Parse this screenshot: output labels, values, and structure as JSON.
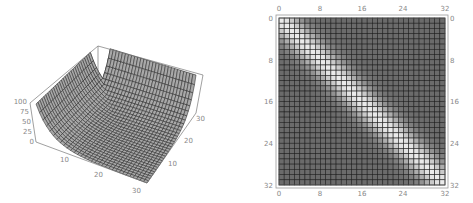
{
  "chart_data": [
    {
      "type": "surface3d",
      "title": "",
      "xlabel": "",
      "ylabel": "",
      "zlabel": "",
      "x_ticks": [
        "10",
        "20",
        "30"
      ],
      "y_ticks": [
        "10",
        "20",
        "30"
      ],
      "z_ticks": [
        "0",
        "25",
        "50",
        "75",
        "100"
      ],
      "xlim": [
        0,
        32
      ],
      "ylim": [
        0,
        32
      ],
      "zlim": [
        0,
        100
      ],
      "grid_size": 32,
      "description": "Mesh surface of a matrix; high values (~100) along two back edges, falling to ~0 over most of the front region (trough shape).",
      "colors": {
        "surface": "#a8a8a8",
        "mesh": "#2a2a2a",
        "box": "#777777"
      }
    },
    {
      "type": "heatmap",
      "title": "",
      "rows": 32,
      "cols": 32,
      "top_ticks": [
        "0",
        "8",
        "16",
        "24",
        "32"
      ],
      "bottom_ticks": [
        "0",
        "8",
        "16",
        "24",
        "32"
      ],
      "left_ticks": [
        "0",
        "8",
        "16",
        "24",
        "32"
      ],
      "right_ticks": [
        "0",
        "8",
        "16",
        "24",
        "32"
      ],
      "xlim": [
        0,
        32
      ],
      "ylim": [
        0,
        32
      ],
      "description": "Grayscale density plot of a 32x32 matrix; bright band along main diagonal (Gaussian falloff, width ~3 cells), dark gray elsewhere.",
      "diagonal_peak": 0.92,
      "background": 0.42,
      "band_sigma": 2.6,
      "colors": {
        "grid": "#222222",
        "frame": "#888888"
      }
    }
  ],
  "surface": {
    "z_labels": [
      "100",
      "75",
      "50",
      "25",
      "0"
    ],
    "front_left_labels": [
      "10",
      "20",
      "30"
    ],
    "front_right_labels": [
      "30",
      "20",
      "10"
    ]
  },
  "density": {
    "top_labels": [
      "0",
      "8",
      "16",
      "24",
      "32"
    ],
    "bottom_labels": [
      "0",
      "8",
      "16",
      "24",
      "32"
    ],
    "left_labels": [
      "0",
      "8",
      "16",
      "24",
      "32"
    ],
    "right_labels": [
      "0",
      "8",
      "16",
      "24",
      "32"
    ]
  }
}
